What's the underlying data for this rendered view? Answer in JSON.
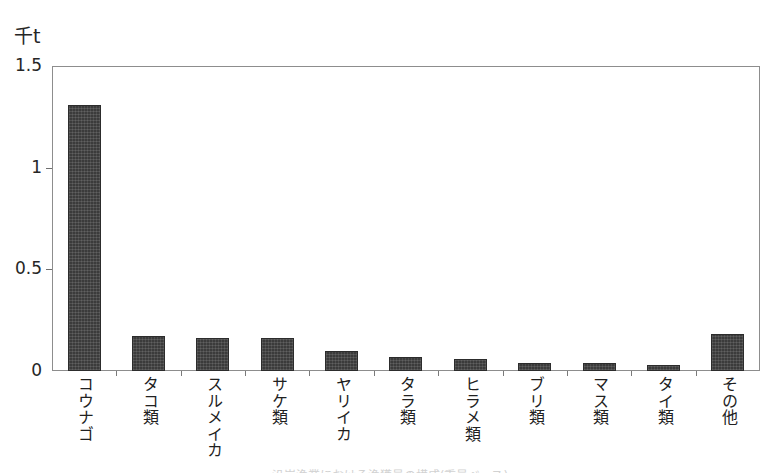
{
  "axes": {
    "y_unit_label": "千t",
    "y_ticks": [
      "0",
      "0.5",
      "1",
      "1.5"
    ]
  },
  "scan": {
    "bottom_caption": "沿岸漁業における漁獲量の構成(重量ベース)"
  },
  "chart_data": {
    "type": "bar",
    "title": "",
    "subtitle": "",
    "xlabel": "",
    "ylabel": "千t",
    "ylim": [
      0,
      1.5
    ],
    "yticks": [
      0,
      0.5,
      1,
      1.5
    ],
    "grid": false,
    "legend": "none",
    "orientation": "vertical",
    "bar_color": "#3b3b3b",
    "categories": [
      "コウナゴ",
      "タコ類",
      "スルメイカ",
      "サケ類",
      "ヤリイカ",
      "タラ類",
      "ヒラメ類",
      "ブリ類",
      "マス類",
      "タイ類",
      "その他"
    ],
    "values": [
      1.31,
      0.17,
      0.16,
      0.16,
      0.1,
      0.07,
      0.06,
      0.04,
      0.04,
      0.03,
      0.18
    ]
  }
}
